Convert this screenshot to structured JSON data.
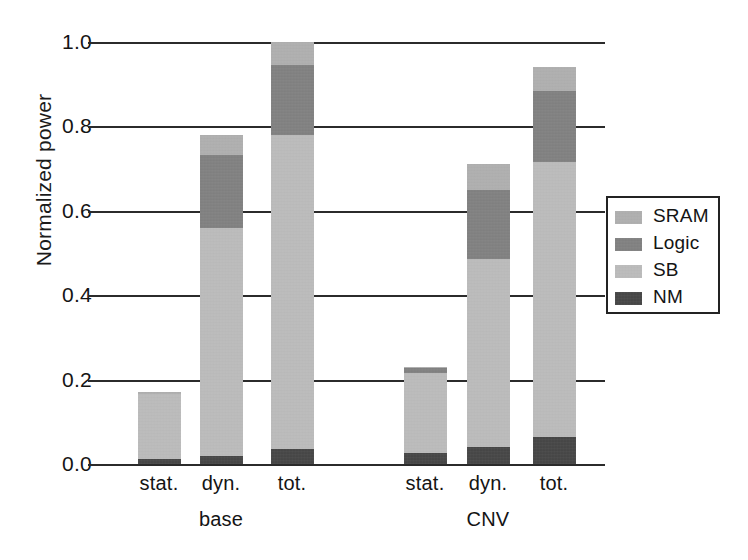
{
  "chart_data": {
    "type": "bar",
    "stacked": true,
    "title": "",
    "xlabel": "",
    "ylabel": "Normalized power",
    "ylim": [
      0.0,
      1.0
    ],
    "yticks": [
      "1.0",
      "0.8",
      "0.6",
      "0.4",
      "0.2",
      "0.0"
    ],
    "ytick_values": [
      1.0,
      0.8,
      0.6,
      0.4,
      0.2,
      0.0
    ],
    "grid": "horizontal",
    "legend_position": "right",
    "groups": [
      {
        "name": "base",
        "categories": [
          "stat.",
          "dyn.",
          "tot."
        ]
      },
      {
        "name": "CNV",
        "categories": [
          "stat.",
          "dyn.",
          "tot."
        ]
      }
    ],
    "categories": [
      "stat.",
      "dyn.",
      "tot.",
      "stat.",
      "dyn.",
      "tot."
    ],
    "series": [
      {
        "name": "NM",
        "color": "#3a3a3a",
        "values": [
          0.012,
          0.02,
          0.035,
          0.025,
          0.04,
          0.065
        ]
      },
      {
        "name": "SB",
        "color": "#c2c2c2",
        "values": [
          0.155,
          0.54,
          0.745,
          0.19,
          0.445,
          0.65
        ]
      },
      {
        "name": "Logic",
        "color": "#7e7e7e",
        "values": [
          0.0,
          0.172,
          0.165,
          0.013,
          0.165,
          0.17
        ]
      },
      {
        "name": "SRAM",
        "color": "#b4b4b4",
        "values": [
          0.003,
          0.048,
          0.055,
          0.002,
          0.06,
          0.055
        ]
      }
    ],
    "totals": [
      0.17,
      0.78,
      1.0,
      0.23,
      0.71,
      0.94
    ]
  },
  "legend": {
    "items": [
      {
        "label": "SRAM",
        "color": "#b4b4b4"
      },
      {
        "label": "Logic",
        "color": "#7e7e7e"
      },
      {
        "label": "SB",
        "color": "#c2c2c2"
      },
      {
        "label": "NM",
        "color": "#3a3a3a"
      }
    ]
  },
  "axis": {
    "y_title": "Normalized power"
  }
}
